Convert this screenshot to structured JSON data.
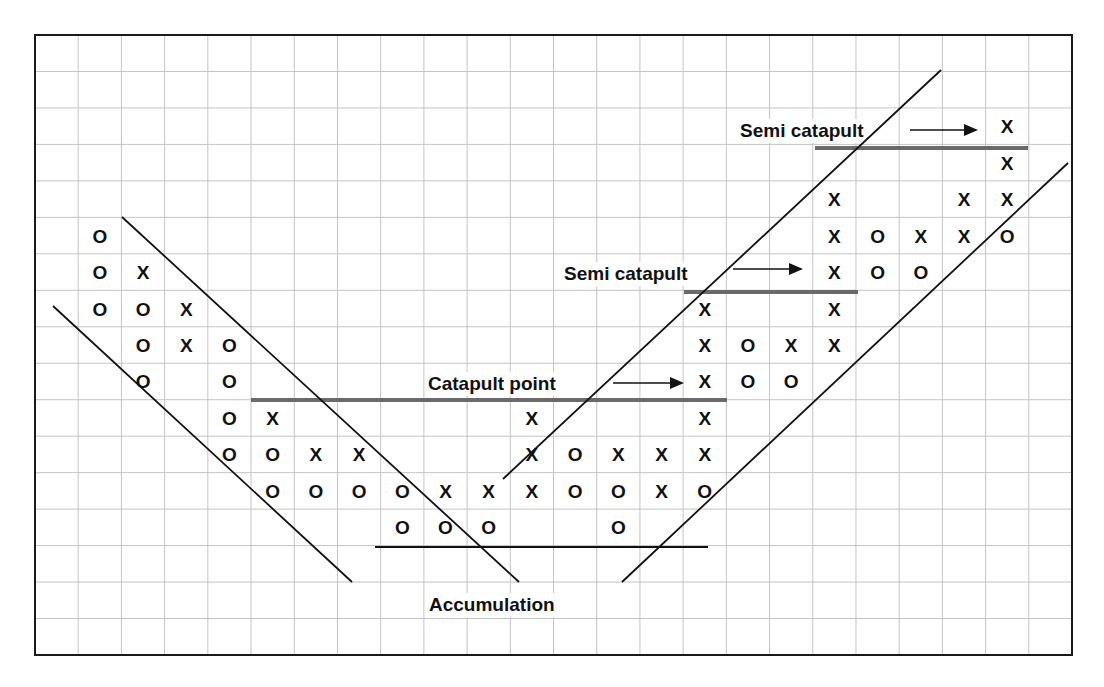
{
  "chart_data": {
    "type": "point-and-figure",
    "title": "",
    "grid": {
      "columns": 24,
      "rows": 17,
      "on": true
    },
    "legend": {
      "X": "rising price box",
      "O": "falling price box"
    },
    "columns": [
      {
        "col": 1,
        "symbol": "O",
        "rows": [
          5,
          6,
          7
        ]
      },
      {
        "col": 2,
        "symbol": "X",
        "rows": [
          6
        ]
      },
      {
        "col": 2,
        "symbol": "O",
        "rows": [
          7,
          8,
          9
        ]
      },
      {
        "col": 3,
        "symbol": "X",
        "rows": [
          7,
          8
        ]
      },
      {
        "col": 4,
        "symbol": "O",
        "rows": [
          8,
          9,
          10,
          11
        ]
      },
      {
        "col": 5,
        "symbol": "X",
        "rows": [
          10
        ]
      },
      {
        "col": 5,
        "symbol": "O",
        "rows": [
          11,
          12
        ]
      },
      {
        "col": 6,
        "symbol": "X",
        "rows": [
          11
        ]
      },
      {
        "col": 6,
        "symbol": "O",
        "rows": [
          12
        ]
      },
      {
        "col": 7,
        "symbol": "X",
        "rows": [
          11
        ]
      },
      {
        "col": 7,
        "symbol": "O",
        "rows": [
          12
        ]
      },
      {
        "col": 8,
        "symbol": "O",
        "rows": [
          12,
          13
        ]
      },
      {
        "col": 9,
        "symbol": "X",
        "rows": [
          12
        ]
      },
      {
        "col": 9,
        "symbol": "O",
        "rows": [
          13
        ]
      },
      {
        "col": 10,
        "symbol": "X",
        "rows": [
          12
        ]
      },
      {
        "col": 10,
        "symbol": "O",
        "rows": [
          13
        ]
      },
      {
        "col": 11,
        "symbol": "X",
        "rows": [
          10,
          11,
          12
        ]
      },
      {
        "col": 12,
        "symbol": "O",
        "rows": [
          11,
          12
        ]
      },
      {
        "col": 13,
        "symbol": "X",
        "rows": [
          11
        ]
      },
      {
        "col": 13,
        "symbol": "O",
        "rows": [
          12,
          13
        ]
      },
      {
        "col": 14,
        "symbol": "X",
        "rows": [
          11,
          12
        ]
      },
      {
        "col": 15,
        "symbol": "X",
        "rows": [
          7,
          8,
          9,
          10,
          11
        ]
      },
      {
        "col": 15,
        "symbol": "O",
        "rows": [
          12
        ]
      },
      {
        "col": 16,
        "symbol": "O",
        "rows": [
          8,
          9
        ]
      },
      {
        "col": 17,
        "symbol": "X",
        "rows": [
          8
        ]
      },
      {
        "col": 17,
        "symbol": "O",
        "rows": [
          9
        ]
      },
      {
        "col": 18,
        "symbol": "X",
        "rows": [
          4,
          5,
          6,
          7,
          8
        ]
      },
      {
        "col": 19,
        "symbol": "O",
        "rows": [
          5,
          6
        ]
      },
      {
        "col": 20,
        "symbol": "X",
        "rows": [
          5
        ]
      },
      {
        "col": 20,
        "symbol": "O",
        "rows": [
          6
        ]
      },
      {
        "col": 21,
        "symbol": "X",
        "rows": [
          4,
          5
        ]
      },
      {
        "col": 22,
        "symbol": "X",
        "rows": [
          2,
          3,
          4
        ]
      },
      {
        "col": 22,
        "symbol": "O",
        "rows": [
          5
        ]
      }
    ],
    "annotations": [
      {
        "text": "Catapult point",
        "x": 428,
        "y": 390,
        "arrow": [
          613,
          383,
          684,
          383
        ]
      },
      {
        "text": "Semi catapult",
        "x": 564,
        "y": 280,
        "arrow": [
          733,
          269,
          803,
          269
        ]
      },
      {
        "text": "Semi catapult",
        "x": 740,
        "y": 137,
        "arrow": [
          910,
          130,
          978,
          130
        ]
      },
      {
        "text": "Accumulation",
        "x": 429,
        "y": 611,
        "arrow": null
      }
    ],
    "levels": [
      {
        "name": "catapult-resistance",
        "x1": 251,
        "x2": 727,
        "y": 400
      },
      {
        "name": "semi-catapult-resistance-1",
        "x1": 684,
        "x2": 858,
        "y": 292
      },
      {
        "name": "semi-catapult-resistance-2",
        "x1": 815,
        "x2": 1028,
        "y": 148
      },
      {
        "name": "accumulation-base",
        "x1": 375,
        "x2": 708,
        "y": 547
      }
    ],
    "trendlines": [
      {
        "name": "downtrend-upper",
        "x1": 122,
        "y1": 217,
        "x2": 519,
        "y2": 582
      },
      {
        "name": "downtrend-lower",
        "x1": 53,
        "y1": 306,
        "x2": 352,
        "y2": 582
      },
      {
        "name": "uptrend-upper",
        "x1": 503,
        "y1": 479,
        "x2": 941,
        "y2": 70
      },
      {
        "name": "uptrend-lower",
        "x1": 622,
        "y1": 582,
        "x2": 1068,
        "y2": 163
      }
    ],
    "xlabel": "",
    "ylabel": ""
  },
  "colors": {
    "grid": "#c4c4c4",
    "level": "#6a6a6a",
    "ink": "#111111"
  },
  "frame": {
    "x": 35,
    "y": 35,
    "width": 1037,
    "height": 620
  }
}
